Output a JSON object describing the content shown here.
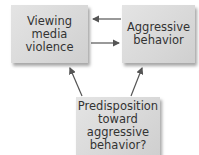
{
  "diagram": {
    "nodes": [
      {
        "id": "viewing",
        "lines": [
          "Viewing",
          "media",
          "violence"
        ]
      },
      {
        "id": "aggressive",
        "lines": [
          "Aggressive",
          "behavior"
        ]
      },
      {
        "id": "predisposition",
        "lines": [
          "Predisposition",
          "toward",
          "aggressive",
          "behavior?"
        ]
      }
    ],
    "edges": [
      {
        "from": "aggressive",
        "to": "viewing"
      },
      {
        "from": "viewing",
        "to": "aggressive"
      },
      {
        "from": "predisposition",
        "to": "viewing"
      },
      {
        "from": "predisposition",
        "to": "aggressive"
      }
    ],
    "colors": {
      "box": "#d9d9d9",
      "arrow": "#555555",
      "text": "#333333"
    }
  }
}
